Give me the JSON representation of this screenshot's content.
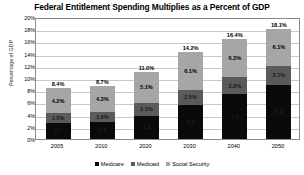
{
  "chart_data": {
    "type": "bar",
    "title": "Federal Entitlement Spending Multiplies as a Percent of GDP",
    "xlabel": "",
    "ylabel": "Percentage of GDP",
    "stacked": true,
    "grid": true,
    "legend_position": "bottom",
    "ylim": [
      0,
      20
    ],
    "ytick_labels": [
      "20%",
      "18%",
      "16%",
      "14%",
      "12%",
      "10%",
      "8%",
      "6%",
      "4%",
      "2%",
      "0%"
    ],
    "ytick_values": [
      20,
      18,
      16,
      14,
      12,
      10,
      8,
      6,
      4,
      2,
      0
    ],
    "categories": [
      "2005",
      "2010",
      "2020",
      "2030",
      "2040",
      "2050"
    ],
    "series": [
      {
        "name": "Medicare",
        "color": "#0a0a0a",
        "values": [
          2.7,
          2.8,
          3.8,
          5.6,
          7.3,
          8.9
        ],
        "labels": [
          "2.7",
          "2.8",
          "3.8",
          "5.6",
          "7.3",
          "8.9"
        ]
      },
      {
        "name": "Medicaid",
        "color": "#5a5a5a",
        "values": [
          1.5,
          1.6,
          2.1,
          2.5,
          2.8,
          3.1
        ],
        "labels": [
          "1.5%",
          "1.6%",
          "2.1%",
          "2.5%",
          "2.8%",
          "3.1%"
        ]
      },
      {
        "name": "Social Security",
        "color": "#a6a6a6",
        "values": [
          4.2,
          4.3,
          5.1,
          6.1,
          6.3,
          6.1
        ],
        "labels": [
          "4.2%",
          "4.3%",
          "5.1%",
          "6.1%",
          "6.3%",
          "6.1%"
        ]
      }
    ],
    "totals": [
      8.4,
      8.7,
      11.0,
      14.2,
      16.4,
      18.1
    ],
    "total_labels": [
      "8.4%",
      "8.7%",
      "11.0%",
      "14.2%",
      "16.4%",
      "18.1%"
    ]
  }
}
